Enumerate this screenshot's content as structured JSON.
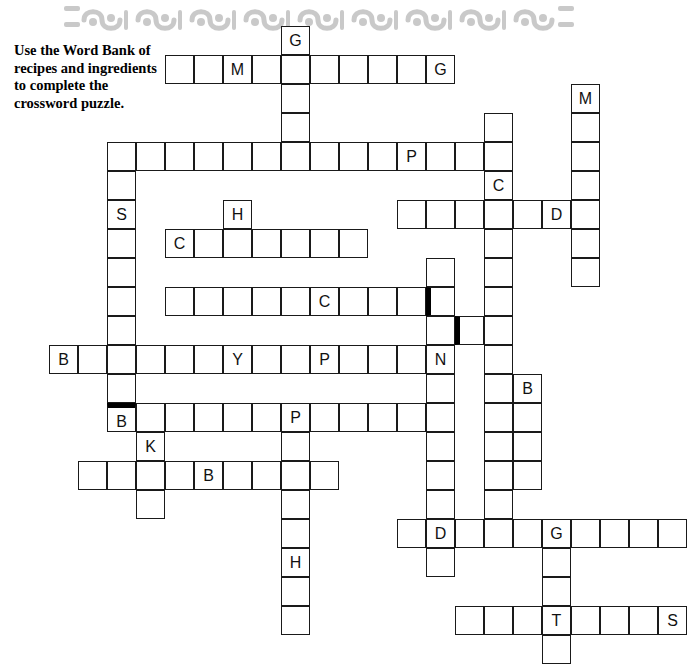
{
  "page": {
    "background_color": "#ffffff",
    "width": 692,
    "height": 563
  },
  "header": {
    "decoration_name": "wave-scroll-border",
    "color": "#c9c9c9",
    "repeats": 7
  },
  "instructions": {
    "text": "Use the Word Bank of recipes and ingredients to complete the crossword puzzle."
  },
  "crossword": {
    "cell_size": 29,
    "origin_x": 49,
    "origin_y": 26,
    "line_color": "#1a1a1a",
    "block_color": "#000000",
    "letter_color": "#111111",
    "cells": [
      {
        "col": 8,
        "row": 0,
        "letter": "G"
      },
      {
        "col": 4,
        "row": 1,
        "letter": ""
      },
      {
        "col": 5,
        "row": 1,
        "letter": ""
      },
      {
        "col": 6,
        "row": 1,
        "letter": "M"
      },
      {
        "col": 7,
        "row": 1,
        "letter": ""
      },
      {
        "col": 8,
        "row": 1,
        "letter": ""
      },
      {
        "col": 9,
        "row": 1,
        "letter": ""
      },
      {
        "col": 10,
        "row": 1,
        "letter": ""
      },
      {
        "col": 11,
        "row": 1,
        "letter": ""
      },
      {
        "col": 12,
        "row": 1,
        "letter": ""
      },
      {
        "col": 13,
        "row": 1,
        "letter": "G"
      },
      {
        "col": 8,
        "row": 2,
        "letter": ""
      },
      {
        "col": 18,
        "row": 2,
        "letter": "M"
      },
      {
        "col": 8,
        "row": 3,
        "letter": ""
      },
      {
        "col": 15,
        "row": 3,
        "letter": ""
      },
      {
        "col": 18,
        "row": 3,
        "letter": ""
      },
      {
        "col": 2,
        "row": 4,
        "letter": ""
      },
      {
        "col": 3,
        "row": 4,
        "letter": ""
      },
      {
        "col": 4,
        "row": 4,
        "letter": ""
      },
      {
        "col": 5,
        "row": 4,
        "letter": ""
      },
      {
        "col": 6,
        "row": 4,
        "letter": ""
      },
      {
        "col": 7,
        "row": 4,
        "letter": ""
      },
      {
        "col": 8,
        "row": 4,
        "letter": ""
      },
      {
        "col": 9,
        "row": 4,
        "letter": ""
      },
      {
        "col": 10,
        "row": 4,
        "letter": ""
      },
      {
        "col": 11,
        "row": 4,
        "letter": ""
      },
      {
        "col": 12,
        "row": 4,
        "letter": "P"
      },
      {
        "col": 13,
        "row": 4,
        "letter": ""
      },
      {
        "col": 14,
        "row": 4,
        "letter": ""
      },
      {
        "col": 15,
        "row": 4,
        "letter": ""
      },
      {
        "col": 18,
        "row": 4,
        "letter": ""
      },
      {
        "col": 2,
        "row": 5,
        "letter": ""
      },
      {
        "col": 15,
        "row": 5,
        "letter": "C"
      },
      {
        "col": 18,
        "row": 5,
        "letter": ""
      },
      {
        "col": 2,
        "row": 6,
        "letter": "S"
      },
      {
        "col": 6,
        "row": 6,
        "letter": "H"
      },
      {
        "col": 12,
        "row": 6,
        "letter": ""
      },
      {
        "col": 13,
        "row": 6,
        "letter": ""
      },
      {
        "col": 14,
        "row": 6,
        "letter": ""
      },
      {
        "col": 15,
        "row": 6,
        "letter": ""
      },
      {
        "col": 16,
        "row": 6,
        "letter": ""
      },
      {
        "col": 17,
        "row": 6,
        "letter": "D"
      },
      {
        "col": 18,
        "row": 6,
        "letter": ""
      },
      {
        "col": 2,
        "row": 7,
        "letter": ""
      },
      {
        "col": 4,
        "row": 7,
        "letter": "C"
      },
      {
        "col": 5,
        "row": 7,
        "letter": ""
      },
      {
        "col": 6,
        "row": 7,
        "letter": ""
      },
      {
        "col": 7,
        "row": 7,
        "letter": ""
      },
      {
        "col": 8,
        "row": 7,
        "letter": ""
      },
      {
        "col": 9,
        "row": 7,
        "letter": ""
      },
      {
        "col": 10,
        "row": 7,
        "letter": ""
      },
      {
        "col": 15,
        "row": 7,
        "letter": ""
      },
      {
        "col": 18,
        "row": 7,
        "letter": ""
      },
      {
        "col": 2,
        "row": 8,
        "letter": ""
      },
      {
        "col": 13,
        "row": 8,
        "letter": ""
      },
      {
        "col": 15,
        "row": 8,
        "letter": ""
      },
      {
        "col": 18,
        "row": 8,
        "letter": ""
      },
      {
        "col": 2,
        "row": 9,
        "letter": ""
      },
      {
        "col": 4,
        "row": 9,
        "letter": ""
      },
      {
        "col": 5,
        "row": 9,
        "letter": ""
      },
      {
        "col": 6,
        "row": 9,
        "letter": ""
      },
      {
        "col": 7,
        "row": 9,
        "letter": ""
      },
      {
        "col": 8,
        "row": 9,
        "letter": ""
      },
      {
        "col": 9,
        "row": 9,
        "letter": "C"
      },
      {
        "col": 10,
        "row": 9,
        "letter": ""
      },
      {
        "col": 11,
        "row": 9,
        "letter": ""
      },
      {
        "col": 12,
        "row": 9,
        "letter": ""
      },
      {
        "col": 13,
        "row": 9,
        "letter": "",
        "block": "left"
      },
      {
        "col": 15,
        "row": 9,
        "letter": ""
      },
      {
        "col": 2,
        "row": 10,
        "letter": ""
      },
      {
        "col": 13,
        "row": 10,
        "letter": ""
      },
      {
        "col": 14,
        "row": 10,
        "letter": "",
        "block": "left"
      },
      {
        "col": 15,
        "row": 10,
        "letter": ""
      },
      {
        "col": 0,
        "row": 11,
        "letter": "B"
      },
      {
        "col": 1,
        "row": 11,
        "letter": ""
      },
      {
        "col": 2,
        "row": 11,
        "letter": ""
      },
      {
        "col": 3,
        "row": 11,
        "letter": ""
      },
      {
        "col": 4,
        "row": 11,
        "letter": ""
      },
      {
        "col": 5,
        "row": 11,
        "letter": ""
      },
      {
        "col": 6,
        "row": 11,
        "letter": "Y"
      },
      {
        "col": 7,
        "row": 11,
        "letter": ""
      },
      {
        "col": 8,
        "row": 11,
        "letter": ""
      },
      {
        "col": 9,
        "row": 11,
        "letter": "P"
      },
      {
        "col": 10,
        "row": 11,
        "letter": ""
      },
      {
        "col": 11,
        "row": 11,
        "letter": ""
      },
      {
        "col": 12,
        "row": 11,
        "letter": ""
      },
      {
        "col": 13,
        "row": 11,
        "letter": "N"
      },
      {
        "col": 15,
        "row": 11,
        "letter": ""
      },
      {
        "col": 2,
        "row": 12,
        "letter": ""
      },
      {
        "col": 13,
        "row": 12,
        "letter": ""
      },
      {
        "col": 15,
        "row": 12,
        "letter": ""
      },
      {
        "col": 16,
        "row": 12,
        "letter": "B"
      },
      {
        "col": 2,
        "row": 13,
        "letter": "B",
        "block": "top"
      },
      {
        "col": 3,
        "row": 13,
        "letter": ""
      },
      {
        "col": 4,
        "row": 13,
        "letter": ""
      },
      {
        "col": 5,
        "row": 13,
        "letter": ""
      },
      {
        "col": 6,
        "row": 13,
        "letter": ""
      },
      {
        "col": 7,
        "row": 13,
        "letter": ""
      },
      {
        "col": 8,
        "row": 13,
        "letter": "P"
      },
      {
        "col": 9,
        "row": 13,
        "letter": ""
      },
      {
        "col": 10,
        "row": 13,
        "letter": ""
      },
      {
        "col": 11,
        "row": 13,
        "letter": ""
      },
      {
        "col": 12,
        "row": 13,
        "letter": ""
      },
      {
        "col": 13,
        "row": 13,
        "letter": ""
      },
      {
        "col": 15,
        "row": 13,
        "letter": ""
      },
      {
        "col": 16,
        "row": 13,
        "letter": ""
      },
      {
        "col": 3,
        "row": 14,
        "letter": "K"
      },
      {
        "col": 8,
        "row": 14,
        "letter": ""
      },
      {
        "col": 13,
        "row": 14,
        "letter": ""
      },
      {
        "col": 15,
        "row": 14,
        "letter": ""
      },
      {
        "col": 16,
        "row": 14,
        "letter": ""
      },
      {
        "col": 1,
        "row": 15,
        "letter": ""
      },
      {
        "col": 2,
        "row": 15,
        "letter": ""
      },
      {
        "col": 3,
        "row": 15,
        "letter": ""
      },
      {
        "col": 4,
        "row": 15,
        "letter": ""
      },
      {
        "col": 5,
        "row": 15,
        "letter": "B"
      },
      {
        "col": 6,
        "row": 15,
        "letter": ""
      },
      {
        "col": 7,
        "row": 15,
        "letter": ""
      },
      {
        "col": 8,
        "row": 15,
        "letter": ""
      },
      {
        "col": 9,
        "row": 15,
        "letter": ""
      },
      {
        "col": 13,
        "row": 15,
        "letter": ""
      },
      {
        "col": 15,
        "row": 15,
        "letter": ""
      },
      {
        "col": 16,
        "row": 15,
        "letter": ""
      },
      {
        "col": 3,
        "row": 16,
        "letter": ""
      },
      {
        "col": 8,
        "row": 16,
        "letter": ""
      },
      {
        "col": 13,
        "row": 16,
        "letter": ""
      },
      {
        "col": 15,
        "row": 16,
        "letter": ""
      },
      {
        "col": 8,
        "row": 17,
        "letter": ""
      },
      {
        "col": 12,
        "row": 17,
        "letter": ""
      },
      {
        "col": 13,
        "row": 17,
        "letter": "D"
      },
      {
        "col": 14,
        "row": 17,
        "letter": ""
      },
      {
        "col": 15,
        "row": 17,
        "letter": ""
      },
      {
        "col": 16,
        "row": 17,
        "letter": ""
      },
      {
        "col": 17,
        "row": 17,
        "letter": "G"
      },
      {
        "col": 18,
        "row": 17,
        "letter": ""
      },
      {
        "col": 19,
        "row": 17,
        "letter": ""
      },
      {
        "col": 20,
        "row": 17,
        "letter": ""
      },
      {
        "col": 21,
        "row": 17,
        "letter": ""
      },
      {
        "col": 8,
        "row": 18,
        "letter": "H"
      },
      {
        "col": 13,
        "row": 18,
        "letter": ""
      },
      {
        "col": 17,
        "row": 18,
        "letter": ""
      },
      {
        "col": 8,
        "row": 19,
        "letter": ""
      },
      {
        "col": 17,
        "row": 19,
        "letter": ""
      },
      {
        "col": 8,
        "row": 20,
        "letter": ""
      },
      {
        "col": 14,
        "row": 20,
        "letter": ""
      },
      {
        "col": 15,
        "row": 20,
        "letter": ""
      },
      {
        "col": 16,
        "row": 20,
        "letter": ""
      },
      {
        "col": 17,
        "row": 20,
        "letter": "T"
      },
      {
        "col": 18,
        "row": 20,
        "letter": ""
      },
      {
        "col": 19,
        "row": 20,
        "letter": ""
      },
      {
        "col": 20,
        "row": 20,
        "letter": ""
      },
      {
        "col": 21,
        "row": 20,
        "letter": "S"
      },
      {
        "col": 17,
        "row": 21,
        "letter": ""
      }
    ]
  }
}
